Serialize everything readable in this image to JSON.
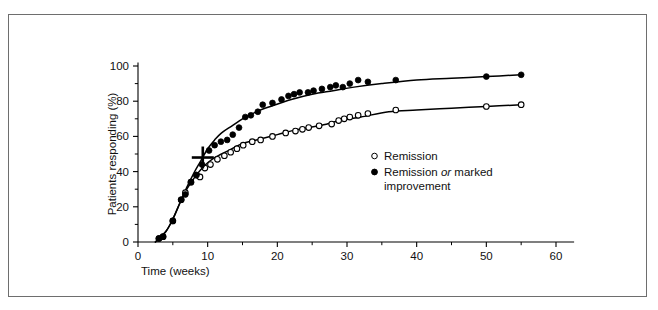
{
  "figure": {
    "background_color": "#ffffff",
    "frame_color": "#6e6e6e",
    "ink_color": "#000000"
  },
  "chart_data": {
    "type": "scatter",
    "title": "",
    "subtitle": "",
    "xlabel": "Time (weeks)",
    "ylabel": "Patients responding (%)",
    "xlim": [
      0,
      62
    ],
    "ylim": [
      0,
      104
    ],
    "xticks": [
      0,
      10,
      20,
      30,
      40,
      50,
      60
    ],
    "xtick_labels": [
      "0",
      "10",
      "20",
      "30",
      "40",
      "50",
      "60"
    ],
    "xminor_ticks": [
      5,
      15,
      25,
      35,
      45,
      55
    ],
    "yticks": [
      0,
      20,
      40,
      60,
      80,
      100
    ],
    "ytick_labels": [
      "0",
      "20",
      "40",
      "60",
      "80",
      "100"
    ],
    "yminor_ticks": [
      10,
      30,
      50,
      70,
      90
    ],
    "grid": false,
    "legend_position": "center-right",
    "series": [
      {
        "name": "Remission",
        "marker": "open-circle",
        "marker_fill": "#ffffff",
        "marker_stroke": "#000000",
        "points": [
          [
            3.0,
            2
          ],
          [
            3.6,
            3
          ],
          [
            5.0,
            12
          ],
          [
            6.2,
            24
          ],
          [
            6.8,
            28
          ],
          [
            7.6,
            34
          ],
          [
            8.4,
            38
          ],
          [
            8.9,
            37
          ],
          [
            9.6,
            42
          ],
          [
            10.4,
            44
          ],
          [
            11.4,
            47
          ],
          [
            12.4,
            49
          ],
          [
            13.3,
            51
          ],
          [
            14.2,
            53
          ],
          [
            15.1,
            55
          ],
          [
            16.4,
            57
          ],
          [
            17.6,
            58
          ],
          [
            19.3,
            60
          ],
          [
            21.2,
            62
          ],
          [
            22.6,
            63
          ],
          [
            23.6,
            64
          ],
          [
            24.5,
            65
          ],
          [
            26.0,
            66
          ],
          [
            27.8,
            67
          ],
          [
            28.8,
            69
          ],
          [
            29.6,
            70
          ],
          [
            30.4,
            71
          ],
          [
            31.6,
            72
          ],
          [
            33.0,
            73
          ],
          [
            37.0,
            75
          ],
          [
            50.0,
            77
          ],
          [
            55.0,
            78
          ]
        ],
        "fit_curve": [
          [
            2.5,
            0
          ],
          [
            4.0,
            6
          ],
          [
            5.0,
            13
          ],
          [
            6.0,
            22
          ],
          [
            7.0,
            30
          ],
          [
            8.0,
            36
          ],
          [
            9.0,
            41
          ],
          [
            10.0,
            45
          ],
          [
            11.0,
            48
          ],
          [
            12.0,
            50
          ],
          [
            13.5,
            53
          ],
          [
            15.0,
            56
          ],
          [
            17.0,
            58
          ],
          [
            20.0,
            61
          ],
          [
            23.0,
            64
          ],
          [
            26.0,
            66
          ],
          [
            29.0,
            69
          ],
          [
            32.0,
            71
          ],
          [
            36.0,
            74
          ],
          [
            40.0,
            75
          ],
          [
            45.0,
            76
          ],
          [
            50.0,
            77
          ],
          [
            55.0,
            78
          ]
        ]
      },
      {
        "name": "Remission or marked improvement",
        "marker": "filled-circle",
        "marker_fill": "#000000",
        "marker_stroke": "#000000",
        "points": [
          [
            3.0,
            2
          ],
          [
            3.6,
            3
          ],
          [
            5.0,
            12
          ],
          [
            6.2,
            24
          ],
          [
            6.8,
            27
          ],
          [
            7.6,
            34
          ],
          [
            8.4,
            38
          ],
          [
            9.2,
            44
          ],
          [
            10.2,
            52
          ],
          [
            11.0,
            55
          ],
          [
            11.9,
            57
          ],
          [
            12.8,
            58
          ],
          [
            13.6,
            61
          ],
          [
            14.5,
            65
          ],
          [
            15.4,
            71
          ],
          [
            16.2,
            72
          ],
          [
            17.2,
            74
          ],
          [
            17.9,
            78
          ],
          [
            19.3,
            79
          ],
          [
            20.6,
            81
          ],
          [
            21.6,
            83
          ],
          [
            22.4,
            84
          ],
          [
            23.2,
            85
          ],
          [
            24.4,
            85
          ],
          [
            25.2,
            86
          ],
          [
            26.4,
            87
          ],
          [
            27.6,
            88
          ],
          [
            28.4,
            89
          ],
          [
            29.4,
            88
          ],
          [
            30.4,
            90
          ],
          [
            31.6,
            92
          ],
          [
            33.0,
            91
          ],
          [
            37.0,
            92
          ],
          [
            50.0,
            94
          ],
          [
            55.0,
            95
          ]
        ],
        "fit_curve": [
          [
            2.5,
            0
          ],
          [
            4.0,
            6
          ],
          [
            5.0,
            13
          ],
          [
            6.0,
            22
          ],
          [
            7.0,
            31
          ],
          [
            8.0,
            39
          ],
          [
            9.0,
            46
          ],
          [
            10.0,
            53
          ],
          [
            11.0,
            58
          ],
          [
            12.0,
            62
          ],
          [
            13.5,
            66
          ],
          [
            15.0,
            70
          ],
          [
            17.0,
            74
          ],
          [
            19.0,
            77
          ],
          [
            22.0,
            81
          ],
          [
            25.0,
            84
          ],
          [
            28.0,
            86
          ],
          [
            31.0,
            88
          ],
          [
            35.0,
            90
          ],
          [
            40.0,
            92
          ],
          [
            45.0,
            93
          ],
          [
            50.0,
            94
          ],
          [
            55.0,
            95
          ]
        ]
      }
    ],
    "annotations": [
      {
        "type": "cross-marker",
        "x": 9.3,
        "y": 48,
        "label": ""
      }
    ]
  },
  "legend": {
    "entries": [
      {
        "marker": "open-circle",
        "label": "Remission",
        "label_line2": ""
      },
      {
        "marker": "filled-circle",
        "label_before": "Remission",
        "label_italic": "or",
        "label_after": "marked",
        "label_line2": "improvement"
      }
    ]
  }
}
